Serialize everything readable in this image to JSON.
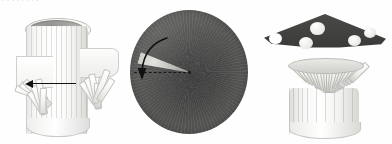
{
  "page": {
    "background_color": "#fefefe",
    "width": 392,
    "height": 144,
    "top_text_fragment": "· ·  ·   ·  ·    ·   ·  ·",
    "caption": ""
  },
  "figure": {
    "panel_count": 3,
    "panels": [
      {
        "id": "panel-tube",
        "step_number": "1",
        "name": "fringed-paper-tube",
        "description": "white paper cylinder with two fringed collars bent outward",
        "annotation": {
          "type": "straight-arrow",
          "direction": "left",
          "label": ""
        },
        "colors": {
          "paper": "#ffffff",
          "shadow": "#d2d2cf",
          "rim_interior": "#8e8e8c",
          "arrow": "#121212"
        },
        "fringe_left_count": 7,
        "fringe_right_count": 7
      },
      {
        "id": "panel-disc",
        "step_number": "2",
        "name": "dark-paper-disc-with-wedge-cut",
        "description": "dark grey circular disc with a radial slit cut from edge to centre",
        "annotation": {
          "type": "curved-arrow",
          "direction": "counter-clockwise-down",
          "label": "",
          "guide_line": "dashed-radius"
        },
        "colors": {
          "disc_center": "#3a3a3a",
          "disc_edge": "#777775",
          "wedge": "#cfcfc9",
          "dashed_line": "#1a1a1a"
        }
      },
      {
        "id": "panel-mushroom",
        "step_number": "3",
        "name": "assembled-paper-mushroom",
        "description": "dark cone cap with white spots fitted onto the fringed white stem",
        "annotation": {
          "type": "none",
          "direction": "",
          "label": ""
        },
        "colors": {
          "cap": "#3c3c3a",
          "spots": "#ffffff",
          "stem": "#ffffff",
          "stem_shadow": "#d6d6d2"
        },
        "spot_count": 4,
        "gill_count": 19
      }
    ]
  },
  "cap_spots": [
    {
      "left": 52,
      "top": 16,
      "size": 15
    },
    {
      "left": 41,
      "top": 31,
      "size": 14
    },
    {
      "left": 90,
      "top": 29,
      "size": 13
    },
    {
      "left": 106,
      "top": 22,
      "size": 12
    }
  ]
}
